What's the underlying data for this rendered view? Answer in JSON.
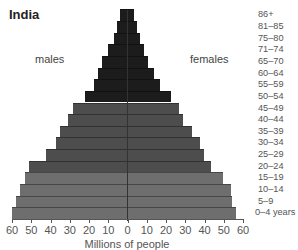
{
  "chart_data": {
    "type": "bar",
    "subtype": "population-pyramid",
    "title": "India",
    "xlabel": "Millions of people",
    "ylabel": "",
    "left_label": "males",
    "right_label": "females",
    "xlim": [
      -60,
      60
    ],
    "x_ticks": [
      60,
      50,
      40,
      30,
      20,
      10,
      0,
      10,
      20,
      30,
      40,
      50,
      60
    ],
    "categories": [
      "0–4 years",
      "5–9",
      "10–14",
      "15–19",
      "20–24",
      "25–29",
      "30–34",
      "35–39",
      "40–44",
      "45–49",
      "50–54",
      "55–59",
      "60–64",
      "65–70",
      "71–74",
      "75–80",
      "81–85",
      "86+"
    ],
    "series": [
      {
        "name": "males",
        "values": [
          60,
          58,
          56,
          53,
          51,
          42,
          37,
          35,
          31,
          28,
          22,
          17,
          15,
          13,
          10,
          7,
          5,
          3.5
        ]
      },
      {
        "name": "females",
        "values": [
          57,
          55,
          54,
          50,
          44,
          40,
          38,
          34,
          29,
          27,
          23,
          17,
          14,
          11,
          9,
          7,
          5,
          3.5
        ]
      }
    ],
    "colors": {
      "young": "#6e6e6e",
      "middle": "#4d4d4d",
      "old": "#1c1c1c"
    },
    "grid": false,
    "legend": "none"
  },
  "labels": {
    "title": "India",
    "males": "males",
    "females": "females",
    "xlabel": "Millions of people"
  }
}
